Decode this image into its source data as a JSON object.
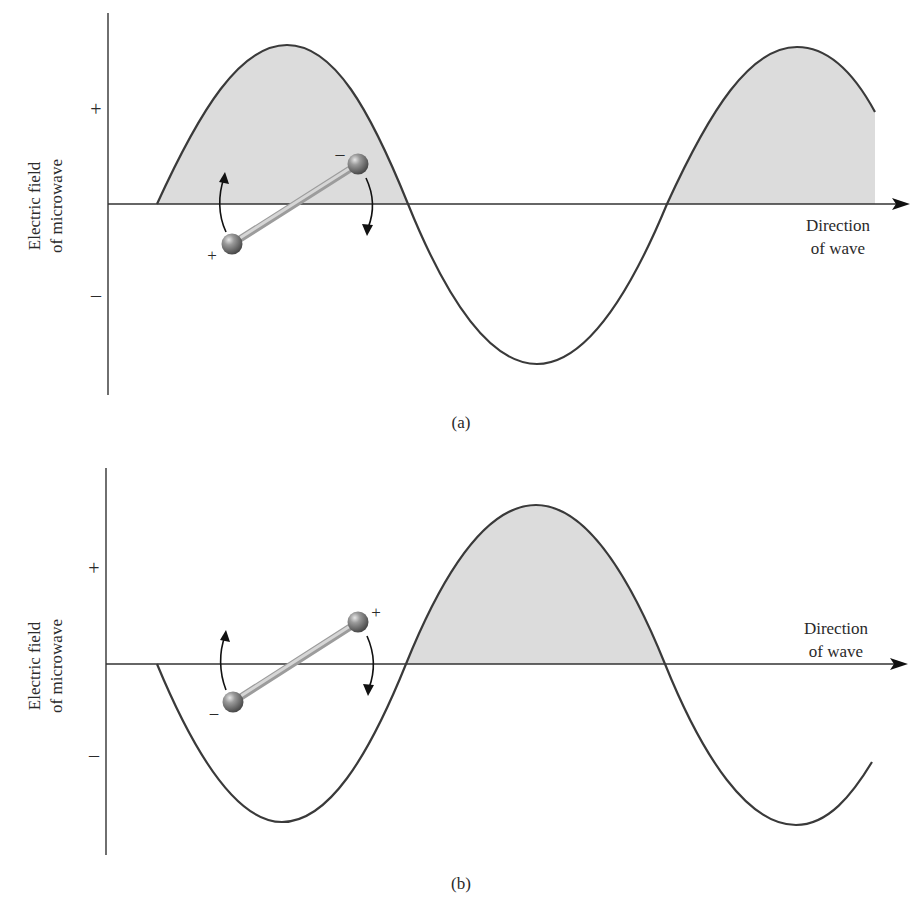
{
  "panels": [
    {
      "id": "a",
      "caption": "(a)",
      "y_axis_label_line1": "Electric field",
      "y_axis_label_line2": "of microwave",
      "y_plus": "+",
      "y_minus": "–",
      "x_axis_label_line1": "Direction",
      "x_axis_label_line2": "of wave",
      "molecule": {
        "left_charge": "+",
        "right_charge": "–"
      }
    },
    {
      "id": "b",
      "caption": "(b)",
      "y_axis_label_line1": "Electric field",
      "y_axis_label_line2": "of microwave",
      "y_plus": "+",
      "y_minus": "–",
      "x_axis_label_line1": "Direction",
      "x_axis_label_line2": "of wave",
      "molecule": {
        "left_charge": "–",
        "right_charge": "+"
      }
    }
  ],
  "colors": {
    "curve": "#3a3a3a",
    "fill": "#dcdcdc",
    "axis": "#333333",
    "bond": "#c8c8c8",
    "atom": "#7a7a7a"
  }
}
